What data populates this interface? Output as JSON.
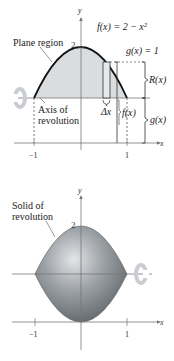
{
  "top_diagram": {
    "function_label": "f(x) = 2 − x²",
    "g_label": "g(x) = 1",
    "plane_region_label": "Plane region",
    "axis_label_line1": "Axis of",
    "axis_label_line2": "revolution",
    "y_axis_label": "y",
    "x_axis_label": "x",
    "y_tick_2": "2",
    "x_tick_neg1": "−1",
    "x_tick_1": "1",
    "delta_x_label": "Δx",
    "R_label": "R(x)",
    "f_label": "f(x)",
    "g_brace_label": "g(x)"
  },
  "bottom_diagram": {
    "solid_label_line1": "Solid of",
    "solid_label_line2": "revolution",
    "y_axis_label": "y",
    "x_axis_label": "x",
    "y_tick_2": "2",
    "x_tick_neg1": "−1",
    "x_tick_1": "1"
  },
  "colors": {
    "region_fill": "#d9dcdf",
    "curve": "#111111",
    "axis": "#666666",
    "rotation_arrow": "#c9cdd1",
    "solid_dark": "#6e7378",
    "solid_light": "#d8dadc"
  }
}
